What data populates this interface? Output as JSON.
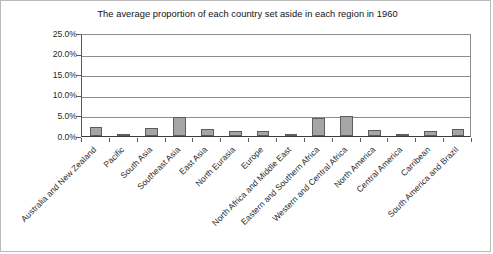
{
  "chart_data": {
    "type": "bar",
    "title": "The average proportion of each country set aside in each region in 1960",
    "xlabel": "",
    "ylabel": "",
    "ylim": [
      0,
      0.25
    ],
    "grid": true,
    "legend": "none",
    "y_tick_labels": [
      "25.0%",
      "20.0%",
      "15.0%",
      "10.0%",
      "5.0%",
      "0.0%"
    ],
    "y_tick_values": [
      25.0,
      20.0,
      15.0,
      10.0,
      5.0,
      0.0
    ],
    "categories": [
      "Australia and New Zealand",
      "Pacific",
      "South Asia",
      "Southeast Asia",
      "East Asia",
      "North Eurasia",
      "Europe",
      "North Africa and Middle East",
      "Eastern and Southern Africa",
      "Western and Central Africa",
      "North America",
      "Central America",
      "Carribean",
      "South America and Brazil"
    ],
    "values": [
      2.2,
      0.3,
      2.0,
      4.6,
      1.8,
      1.2,
      1.2,
      0.5,
      4.4,
      4.8,
      1.4,
      0.5,
      1.1,
      1.6
    ],
    "value_unit": "percent",
    "series": [
      {
        "name": "Average proportion set aside",
        "values": [
          2.2,
          0.3,
          2.0,
          4.6,
          1.8,
          1.2,
          1.2,
          0.5,
          4.4,
          4.8,
          1.4,
          0.5,
          1.1,
          1.6
        ]
      }
    ],
    "colors": {
      "bar_fill": "#a5a5a5",
      "bar_border": "#5d5d5d",
      "gridline": "#8c8c8c",
      "axis": "#3d3d3d",
      "background": "#ffffff",
      "frame": "#b9b9b9",
      "text": "#1a1a1a"
    }
  }
}
